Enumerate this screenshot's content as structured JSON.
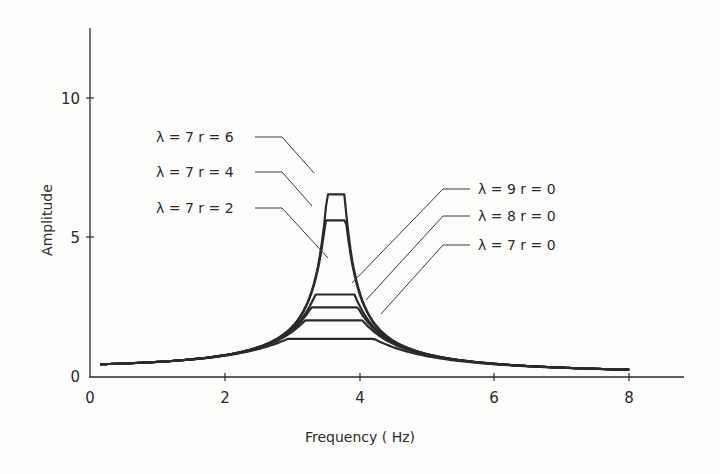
{
  "chart_data": {
    "type": "line",
    "title": "",
    "xlabel": "Frequency ( Hz)",
    "ylabel": "Amplitude",
    "xlim": [
      0,
      8.8
    ],
    "ylim": [
      0,
      10.5
    ],
    "x_ticks": [
      0,
      2,
      4,
      6,
      8
    ],
    "y_ticks": [
      0,
      5,
      10
    ],
    "grid": false,
    "legend": "inline leader-line labels",
    "resonance_frequency_hz": 3.65,
    "x_range_plotted": [
      0.15,
      8.0
    ],
    "series": [
      {
        "name": "λ = 7  r = 6",
        "lambda": 7,
        "r": 6,
        "peak": 9.8,
        "peak_x": 3.65,
        "x": [
          0.15,
          1,
          2,
          3,
          3.65,
          4.5,
          5,
          6,
          7,
          8
        ],
        "values": [
          0.35,
          0.7,
          2.0,
          5.2,
          9.8,
          3.6,
          2.2,
          1.1,
          0.6,
          0.25
        ]
      },
      {
        "name": "λ = 7  r = 4",
        "lambda": 7,
        "r": 4,
        "peak": 8.4,
        "peak_x": 3.65,
        "x": [
          0.15,
          1,
          2,
          3,
          3.65,
          4.5,
          5,
          6,
          7,
          8
        ],
        "values": [
          0.33,
          0.68,
          1.85,
          4.8,
          8.4,
          3.5,
          2.1,
          1.05,
          0.55,
          0.22
        ]
      },
      {
        "name": "λ = 7  r = 2",
        "lambda": 7,
        "r": 2,
        "peak": 4.4,
        "peak_x": 3.65,
        "x": [
          0.15,
          1,
          2,
          3,
          3.65,
          4.5,
          5,
          6,
          7,
          8
        ],
        "values": [
          0.3,
          0.6,
          1.25,
          3.0,
          4.4,
          2.9,
          1.9,
          0.95,
          0.5,
          0.2
        ]
      },
      {
        "name": "λ = 9  r = 0",
        "lambda": 9,
        "r": 0,
        "peak": 3.7,
        "peak_x": 3.65,
        "x": [
          0.15,
          1,
          2,
          3,
          3.65,
          4.5,
          5,
          6,
          7,
          8
        ],
        "values": [
          0.28,
          0.55,
          1.15,
          2.7,
          3.7,
          2.6,
          1.8,
          0.9,
          0.45,
          0.18
        ]
      },
      {
        "name": "λ = 8  r = 0",
        "lambda": 8,
        "r": 0,
        "peak": 3.0,
        "peak_x": 3.65,
        "x": [
          0.15,
          1,
          2,
          3,
          3.65,
          4.5,
          5,
          6,
          7,
          8
        ],
        "values": [
          0.25,
          0.5,
          1.05,
          2.3,
          3.0,
          2.25,
          1.6,
          0.85,
          0.42,
          0.16
        ]
      },
      {
        "name": "λ = 7  r = 0",
        "lambda": 7,
        "r": 0,
        "peak": 2.0,
        "peak_x": 3.65,
        "x": [
          0.15,
          1,
          2,
          3,
          3.65,
          4.5,
          5,
          6,
          7,
          8
        ],
        "values": [
          0.22,
          0.45,
          0.9,
          1.7,
          2.0,
          1.75,
          1.35,
          0.8,
          0.4,
          0.15
        ]
      }
    ],
    "labels": [
      {
        "text": "λ = 7  r = 6",
        "series": 0
      },
      {
        "text": "λ = 7  r = 4",
        "series": 1
      },
      {
        "text": "λ = 7  r = 2",
        "series": 2
      },
      {
        "text": "λ = 9  r = 0",
        "series": 3
      },
      {
        "text": "λ = 8  r = 0",
        "series": 4
      },
      {
        "text": "λ = 7  r = 0",
        "series": 5
      }
    ]
  },
  "axes": {
    "x_title": "Frequency ( Hz)",
    "y_title": "Amplitude",
    "x_tick_labels": [
      "0",
      "2",
      "4",
      "6",
      "8"
    ],
    "y_tick_labels": [
      "0",
      "5",
      "10"
    ]
  },
  "style": {
    "ink": "#2a2a2a",
    "background": "#fdfdfc"
  }
}
